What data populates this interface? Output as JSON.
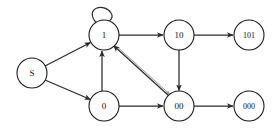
{
  "diagram": {
    "type": "directed-graph",
    "width": 280,
    "height": 131,
    "background_color": "#ffffff",
    "node_stroke_color": "#1a1a1a",
    "node_fill_color": "#ffffff",
    "edge_color": "#2b2b2b",
    "edge_color_faint": "#8d8d8d",
    "label_color": "#111111",
    "nodes": [
      {
        "id": "S",
        "label": "S",
        "cx": 32,
        "cy": 73,
        "r": 15,
        "font_size": 9
      },
      {
        "id": "1",
        "label": "1",
        "cx": 104,
        "cy": 35,
        "r": 15,
        "font_size": 9
      },
      {
        "id": "0",
        "label": "0",
        "cx": 104,
        "cy": 106,
        "r": 15,
        "font_size": 9
      },
      {
        "id": "10",
        "label": "10",
        "cx": 179,
        "cy": 35,
        "r": 15,
        "font_size": 9
      },
      {
        "id": "00",
        "label": "00",
        "cx": 179,
        "cy": 106,
        "r": 15,
        "font_size": 9
      },
      {
        "id": "101",
        "label": "101",
        "cx": 249,
        "cy": 35,
        "r": 15,
        "font_size": 8
      },
      {
        "id": "000",
        "label": "000",
        "cx": 249,
        "cy": 106,
        "r": 15,
        "font_size": 8
      }
    ],
    "edges": [
      {
        "id": "S-1",
        "from": "S",
        "to": "1",
        "label": "",
        "style": "solid",
        "kind": "straight"
      },
      {
        "id": "S-0",
        "from": "S",
        "to": "0",
        "label": "",
        "style": "solid",
        "kind": "straight"
      },
      {
        "id": "1-1",
        "from": "1",
        "to": "1",
        "label": "",
        "style": "solid",
        "kind": "self-loop"
      },
      {
        "id": "1-10",
        "from": "1",
        "to": "10",
        "label": "",
        "style": "solid",
        "kind": "straight"
      },
      {
        "id": "0-1",
        "from": "0",
        "to": "1",
        "label": "",
        "style": "solid",
        "kind": "straight"
      },
      {
        "id": "0-00",
        "from": "0",
        "to": "00",
        "label": "",
        "style": "solid",
        "kind": "straight"
      },
      {
        "id": "10-101",
        "from": "10",
        "to": "101",
        "label": "",
        "style": "solid",
        "kind": "straight"
      },
      {
        "id": "10-00",
        "from": "10",
        "to": "00",
        "label": "",
        "style": "solid",
        "kind": "straight"
      },
      {
        "id": "00-1",
        "from": "00",
        "to": "1",
        "label": "",
        "style": "solid",
        "kind": "diagonal"
      },
      {
        "id": "1-00",
        "from": "1",
        "to": "00",
        "label": "",
        "style": "faint",
        "kind": "diagonal"
      },
      {
        "id": "00-000",
        "from": "00",
        "to": "000",
        "label": "",
        "style": "solid",
        "kind": "straight"
      }
    ]
  }
}
